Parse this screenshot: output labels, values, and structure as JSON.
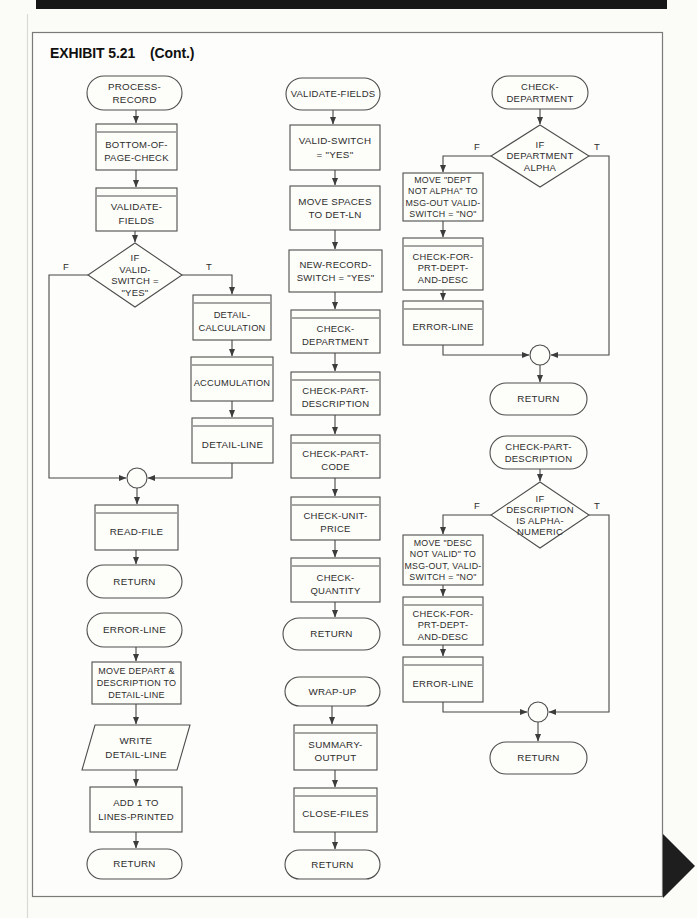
{
  "page": {
    "exhibit_label": "EXHIBIT 5.21",
    "exhibit_cont": "(Cont.)"
  },
  "colors": {
    "line": "#474747",
    "text": "#2d2d2d",
    "top_bar": "#171717",
    "corner_triangle": "#1e1e1e",
    "paper": "#fbfbf8"
  },
  "flowchart": {
    "nodes": [
      {
        "name": "process-record-terminator",
        "type": "terminator",
        "x": 87,
        "y": 76,
        "w": 95,
        "h": 34,
        "lines": [
          "PROCESS-",
          "RECORD"
        ],
        "lh": 13.5
      },
      {
        "name": "bottom-of-page-check-module",
        "type": "predefined",
        "x": 96,
        "y": 124,
        "w": 81,
        "h": 46,
        "lines": [
          "BOTTOM-OF-",
          "PAGE-CHECK"
        ],
        "lh": 13.5,
        "fs": 9.5
      },
      {
        "name": "validate-fields-module",
        "type": "predefined",
        "x": 96,
        "y": 188,
        "w": 81,
        "h": 43,
        "lines": [
          "VALIDATE-",
          "FIELDS"
        ],
        "lh": 13.5
      },
      {
        "name": "if-valid-switch-decision",
        "type": "decision",
        "cx": 135,
        "cy": 275,
        "w": 94,
        "h": 64,
        "lines": [
          "IF",
          "VALID-",
          "SWITCH =",
          "\"YES\""
        ],
        "fs": 9.5,
        "lh": 11.5
      },
      {
        "name": "detail-calculation-module",
        "type": "predefined",
        "x": 193,
        "y": 295,
        "w": 78,
        "h": 45,
        "lines": [
          "DETAIL-",
          "CALCULATION"
        ],
        "fs": 9.3,
        "lh": 13
      },
      {
        "name": "accumulation-module",
        "type": "predefined",
        "x": 191,
        "y": 357,
        "w": 82,
        "h": 44,
        "lines": [
          "ACCUMULATION"
        ],
        "fs": 9.3
      },
      {
        "name": "detail-line-module",
        "type": "predefined",
        "x": 192,
        "y": 418,
        "w": 81,
        "h": 45,
        "lines": [
          "DETAIL-LINE"
        ]
      },
      {
        "name": "connector-circle-1",
        "type": "connector",
        "cx": 137,
        "cy": 478,
        "r": 10
      },
      {
        "name": "read-file-module",
        "type": "predefined",
        "x": 95,
        "y": 505,
        "w": 83,
        "h": 45,
        "lines": [
          "READ-FILE"
        ]
      },
      {
        "name": "return-terminator-1",
        "type": "terminator",
        "x": 87,
        "y": 565,
        "w": 95,
        "h": 33,
        "lines": [
          "RETURN"
        ]
      },
      {
        "name": "error-line-terminator",
        "type": "terminator",
        "x": 87,
        "y": 613,
        "w": 95,
        "h": 34,
        "lines": [
          "ERROR-LINE"
        ]
      },
      {
        "name": "move-depart-description-process",
        "type": "process",
        "x": 92,
        "y": 662,
        "w": 89,
        "h": 42,
        "lines": [
          "MOVE DEPART &",
          "DESCRIPTION TO",
          "DETAIL-LINE"
        ],
        "fs": 9,
        "lh": 12.3
      },
      {
        "name": "write-detail-line-io",
        "type": "io",
        "x": 82,
        "y": 725,
        "w": 108,
        "h": 45,
        "skew": 13,
        "lines": [
          "WRITE",
          "DETAIL-LINE"
        ],
        "lh": 13.5
      },
      {
        "name": "add-1-to-lines-printed-process",
        "type": "process",
        "x": 90,
        "y": 787,
        "w": 92,
        "h": 45,
        "lines": [
          "ADD 1 TO",
          "LINES-PRINTED"
        ],
        "fs": 9.5,
        "lh": 13.5
      },
      {
        "name": "return-terminator-2",
        "type": "terminator",
        "x": 87,
        "y": 849,
        "w": 95,
        "h": 30,
        "lines": [
          "RETURN"
        ]
      },
      {
        "name": "validate-fields-terminator",
        "type": "terminator",
        "x": 286,
        "y": 78,
        "w": 94,
        "h": 32,
        "lines": [
          "VALIDATE-FIELDS"
        ],
        "fs": 9.5
      },
      {
        "name": "valid-switch-yes-process",
        "type": "process",
        "x": 290,
        "y": 125,
        "w": 90,
        "h": 45,
        "lines": [
          "VALID-SWITCH",
          "= \"YES\""
        ],
        "lh": 13.5
      },
      {
        "name": "move-spaces-process",
        "type": "process",
        "x": 290,
        "y": 186,
        "w": 90,
        "h": 44,
        "lines": [
          "MOVE SPACES",
          "TO DET-LN"
        ],
        "lh": 13.5
      },
      {
        "name": "new-record-switch-process",
        "type": "process",
        "x": 289,
        "y": 250,
        "w": 93,
        "h": 42,
        "lines": [
          "NEW-RECORD-",
          "SWITCH = \"YES\""
        ],
        "fs": 9.5,
        "lh": 13.5
      },
      {
        "name": "check-department-module",
        "type": "predefined",
        "x": 291,
        "y": 310,
        "w": 89,
        "h": 43,
        "lines": [
          "CHECK-",
          "DEPARTMENT"
        ],
        "fs": 9.5,
        "lh": 13
      },
      {
        "name": "check-part-description-module",
        "type": "predefined",
        "x": 291,
        "y": 372,
        "w": 89,
        "h": 43,
        "lines": [
          "CHECK-PART-",
          "DESCRIPTION"
        ],
        "fs": 9.5,
        "lh": 13
      },
      {
        "name": "check-part-code-module",
        "type": "predefined",
        "x": 291,
        "y": 435,
        "w": 89,
        "h": 43,
        "lines": [
          "CHECK-PART-",
          "CODE"
        ],
        "fs": 9.5,
        "lh": 13
      },
      {
        "name": "check-unit-price-module",
        "type": "predefined",
        "x": 291,
        "y": 497,
        "w": 89,
        "h": 43,
        "lines": [
          "CHECK-UNIT-",
          "PRICE"
        ],
        "fs": 9.5,
        "lh": 13
      },
      {
        "name": "check-quantity-module",
        "type": "predefined",
        "x": 291,
        "y": 558,
        "w": 89,
        "h": 44,
        "lines": [
          "CHECK-",
          "QUANTITY"
        ],
        "fs": 9.5,
        "lh": 13
      },
      {
        "name": "return-terminator-3",
        "type": "terminator",
        "x": 283,
        "y": 618,
        "w": 97,
        "h": 32,
        "lines": [
          "RETURN"
        ]
      },
      {
        "name": "wrap-up-terminator",
        "type": "terminator",
        "x": 285,
        "y": 677,
        "w": 95,
        "h": 29,
        "lines": [
          "WRAP-UP"
        ]
      },
      {
        "name": "summary-output-module",
        "type": "predefined",
        "x": 294,
        "y": 725,
        "w": 83,
        "h": 45,
        "lines": [
          "SUMMARY-",
          "OUTPUT"
        ],
        "lh": 13
      },
      {
        "name": "close-files-module",
        "type": "predefined",
        "x": 294,
        "y": 788,
        "w": 83,
        "h": 44,
        "lines": [
          "CLOSE-FILES"
        ]
      },
      {
        "name": "return-terminator-4",
        "type": "terminator",
        "x": 285,
        "y": 850,
        "w": 95,
        "h": 29,
        "lines": [
          "RETURN"
        ]
      },
      {
        "name": "check-department-terminator",
        "type": "terminator",
        "x": 492,
        "y": 76,
        "w": 96,
        "h": 33,
        "lines": [
          "CHECK-",
          "DEPARTMENT"
        ],
        "fs": 9.5,
        "lh": 12
      },
      {
        "name": "if-department-alpha-decision",
        "type": "decision",
        "cx": 540,
        "cy": 156,
        "w": 98,
        "h": 62,
        "lines": [
          "IF",
          "DEPARTMENT",
          "ALPHA"
        ],
        "fs": 9.5,
        "lh": 11.5
      },
      {
        "name": "move-dept-not-alpha-process",
        "type": "process",
        "x": 403,
        "y": 173,
        "w": 80,
        "h": 48,
        "lines": [
          "MOVE \"DEPT",
          "NOT ALPHA\" TO",
          "MSG-OUT VALID-",
          "SWITCH = \"NO\""
        ],
        "fs": 8.8,
        "lh": 11.6
      },
      {
        "name": "check-for-prt-dept-and-desc-module-1",
        "type": "predefined",
        "x": 403,
        "y": 238,
        "w": 80,
        "h": 52,
        "lines": [
          "CHECK-FOR-",
          "PRT-DEPT-",
          "AND-DESC"
        ],
        "fs": 9.3,
        "lh": 11.6
      },
      {
        "name": "error-line-module-1",
        "type": "predefined",
        "x": 403,
        "y": 301,
        "w": 80,
        "h": 44,
        "lines": [
          "ERROR-LINE"
        ],
        "fs": 9.5
      },
      {
        "name": "connector-circle-2",
        "type": "connector",
        "cx": 540,
        "cy": 355,
        "r": 10
      },
      {
        "name": "return-terminator-5",
        "type": "terminator",
        "x": 490,
        "y": 383,
        "w": 97,
        "h": 32,
        "lines": [
          "RETURN"
        ]
      },
      {
        "name": "check-part-description-terminator",
        "type": "terminator",
        "x": 490,
        "y": 436,
        "w": 97,
        "h": 33,
        "lines": [
          "CHECK-PART-",
          "DESCRIPTION"
        ],
        "fs": 9.5,
        "lh": 12
      },
      {
        "name": "if-description-alphanumeric-decision",
        "type": "decision",
        "cx": 540,
        "cy": 515,
        "w": 98,
        "h": 66,
        "lines": [
          "IF",
          "DESCRIPTION",
          "IS ALPHA-",
          "NUMERIC"
        ],
        "fs": 9.5,
        "lh": 11
      },
      {
        "name": "move-desc-not-valid-process",
        "type": "process",
        "x": 403,
        "y": 535,
        "w": 80,
        "h": 50,
        "lines": [
          "MOVE \"DESC",
          "NOT VALID\" TO",
          "MSG-OUT, VALID-",
          "SWITCH = \"NO\""
        ],
        "fs": 8.8,
        "lh": 11.6
      },
      {
        "name": "check-for-prt-dept-and-desc-module-2",
        "type": "predefined",
        "x": 403,
        "y": 597,
        "w": 80,
        "h": 48,
        "lines": [
          "CHECK-FOR-",
          "PRT-DEPT-",
          "AND-DESC"
        ],
        "fs": 9.3,
        "lh": 11.3
      },
      {
        "name": "error-line-module-2",
        "type": "predefined",
        "x": 403,
        "y": 657,
        "w": 80,
        "h": 45,
        "lines": [
          "ERROR-LINE"
        ],
        "fs": 9.5
      },
      {
        "name": "connector-circle-3",
        "type": "connector",
        "cx": 538,
        "cy": 712,
        "r": 10
      },
      {
        "name": "return-terminator-6",
        "type": "terminator",
        "x": 490,
        "y": 742,
        "w": 97,
        "h": 32,
        "lines": [
          "RETURN"
        ]
      }
    ],
    "edges": [
      {
        "pts": [
          [
            136,
            110
          ],
          [
            136,
            123
          ]
        ]
      },
      {
        "pts": [
          [
            136,
            170
          ],
          [
            136,
            187
          ]
        ]
      },
      {
        "pts": [
          [
            135,
            231
          ],
          [
            135,
            242
          ]
        ]
      },
      {
        "pts": [
          [
            88,
            275
          ],
          [
            49,
            275
          ],
          [
            49,
            478
          ],
          [
            126,
            478
          ]
        ]
      },
      {
        "pts": [
          [
            182,
            275
          ],
          [
            232,
            275
          ],
          [
            232,
            294
          ]
        ]
      },
      {
        "pts": [
          [
            232,
            340
          ],
          [
            232,
            356
          ]
        ]
      },
      {
        "pts": [
          [
            232,
            401
          ],
          [
            232,
            417
          ]
        ]
      },
      {
        "pts": [
          [
            232,
            463
          ],
          [
            232,
            478
          ],
          [
            148,
            478
          ]
        ]
      },
      {
        "pts": [
          [
            137,
            488
          ],
          [
            137,
            504
          ]
        ]
      },
      {
        "pts": [
          [
            136,
            550
          ],
          [
            136,
            564
          ]
        ]
      },
      {
        "pts": [
          [
            136,
            647
          ],
          [
            136,
            661
          ]
        ]
      },
      {
        "pts": [
          [
            136,
            704
          ],
          [
            136,
            724
          ]
        ]
      },
      {
        "pts": [
          [
            136,
            770
          ],
          [
            136,
            786
          ]
        ]
      },
      {
        "pts": [
          [
            136,
            832
          ],
          [
            136,
            848
          ]
        ]
      },
      {
        "pts": [
          [
            333,
            110
          ],
          [
            333,
            124
          ]
        ]
      },
      {
        "pts": [
          [
            335,
            170
          ],
          [
            335,
            185
          ]
        ]
      },
      {
        "pts": [
          [
            335,
            230
          ],
          [
            335,
            249
          ]
        ]
      },
      {
        "pts": [
          [
            335,
            292
          ],
          [
            335,
            309
          ]
        ]
      },
      {
        "pts": [
          [
            335,
            353
          ],
          [
            335,
            371
          ]
        ]
      },
      {
        "pts": [
          [
            335,
            415
          ],
          [
            335,
            434
          ]
        ]
      },
      {
        "pts": [
          [
            335,
            478
          ],
          [
            335,
            496
          ]
        ]
      },
      {
        "pts": [
          [
            335,
            540
          ],
          [
            335,
            557
          ]
        ]
      },
      {
        "pts": [
          [
            335,
            602
          ],
          [
            335,
            617
          ]
        ]
      },
      {
        "pts": [
          [
            332,
            706
          ],
          [
            332,
            724
          ]
        ]
      },
      {
        "pts": [
          [
            335,
            770
          ],
          [
            335,
            787
          ]
        ]
      },
      {
        "pts": [
          [
            335,
            832
          ],
          [
            335,
            849
          ]
        ]
      },
      {
        "pts": [
          [
            540,
            109
          ],
          [
            540,
            124
          ]
        ]
      },
      {
        "pts": [
          [
            491,
            156
          ],
          [
            443,
            156
          ],
          [
            443,
            172
          ]
        ]
      },
      {
        "pts": [
          [
            589,
            156
          ],
          [
            609,
            156
          ],
          [
            609,
            355
          ],
          [
            551,
            355
          ]
        ]
      },
      {
        "pts": [
          [
            443,
            221
          ],
          [
            443,
            237
          ]
        ]
      },
      {
        "pts": [
          [
            443,
            290
          ],
          [
            443,
            300
          ]
        ]
      },
      {
        "pts": [
          [
            443,
            345
          ],
          [
            443,
            355
          ],
          [
            529,
            355
          ]
        ]
      },
      {
        "pts": [
          [
            540,
            365
          ],
          [
            540,
            382
          ]
        ]
      },
      {
        "pts": [
          [
            540,
            469
          ],
          [
            540,
            481
          ]
        ]
      },
      {
        "pts": [
          [
            491,
            515
          ],
          [
            443,
            515
          ],
          [
            443,
            534
          ]
        ]
      },
      {
        "pts": [
          [
            589,
            515
          ],
          [
            609,
            515
          ],
          [
            609,
            712
          ],
          [
            549,
            712
          ]
        ]
      },
      {
        "pts": [
          [
            443,
            585
          ],
          [
            443,
            596
          ]
        ]
      },
      {
        "pts": [
          [
            443,
            645
          ],
          [
            443,
            656
          ]
        ]
      },
      {
        "pts": [
          [
            443,
            702
          ],
          [
            443,
            712
          ],
          [
            527,
            712
          ]
        ]
      },
      {
        "pts": [
          [
            538,
            722
          ],
          [
            538,
            741
          ]
        ]
      }
    ],
    "branch_labels": [
      {
        "text": "F",
        "x": 66,
        "y": 270
      },
      {
        "text": "T",
        "x": 209,
        "y": 270
      },
      {
        "text": "F",
        "x": 477,
        "y": 150
      },
      {
        "text": "T",
        "x": 597,
        "y": 150
      },
      {
        "text": "F",
        "x": 477,
        "y": 509
      },
      {
        "text": "T",
        "x": 597,
        "y": 509
      }
    ]
  }
}
